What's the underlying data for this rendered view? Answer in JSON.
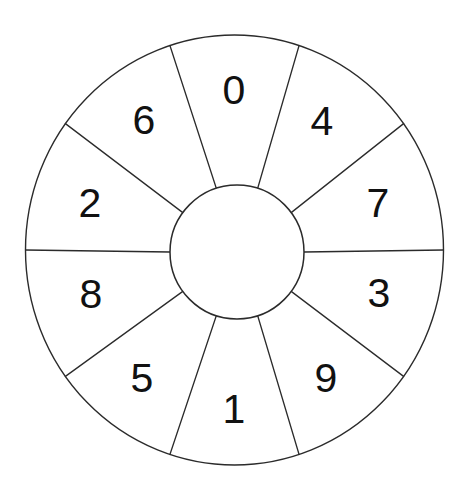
{
  "figure": {
    "kind": "segmented-number-wheel",
    "background_color": "#ffffff",
    "line_color": "#2b2b2b",
    "label_color": "#111111",
    "segment_count": 10,
    "segment_angle_degrees": 36,
    "outer_circle": {
      "center_x": 234.5,
      "center_y": 250,
      "radius_x": 209,
      "radius_y": 215
    },
    "inner_circle": {
      "center_x": 237,
      "center_y": 252,
      "radius": 67
    },
    "labels_clockwise_from_top": [
      "0",
      "4",
      "7",
      "3",
      "9",
      "1",
      "5",
      "8",
      "2",
      "6"
    ],
    "segments": [
      {
        "label": "0",
        "center_angle_degrees": 90,
        "label_x": 234,
        "label_y": 93
      },
      {
        "label": "4",
        "center_angle_degrees": 54,
        "label_x": 322,
        "label_y": 124
      },
      {
        "label": "7",
        "center_angle_degrees": 18,
        "label_x": 378,
        "label_y": 206
      },
      {
        "label": "3",
        "center_angle_degrees": 342,
        "label_x": 379,
        "label_y": 296
      },
      {
        "label": "9",
        "center_angle_degrees": 306,
        "label_x": 326,
        "label_y": 381
      },
      {
        "label": "1",
        "center_angle_degrees": 270,
        "label_x": 234,
        "label_y": 412
      },
      {
        "label": "5",
        "center_angle_degrees": 234,
        "label_x": 142,
        "label_y": 381
      },
      {
        "label": "8",
        "center_angle_degrees": 198,
        "label_x": 91,
        "label_y": 297
      },
      {
        "label": "2",
        "center_angle_degrees": 162,
        "label_x": 90,
        "label_y": 206
      },
      {
        "label": "6",
        "center_angle_degrees": 126,
        "label_x": 144,
        "label_y": 123
      }
    ]
  }
}
